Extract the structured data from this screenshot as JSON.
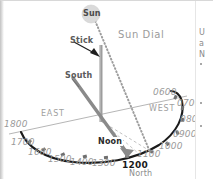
{
  "figure": {
    "title": "Sun Dial",
    "sun_label": "Sun",
    "stick_label": "Stick",
    "south_label": "South",
    "noon_label": "Noon",
    "east_label": "EAST",
    "west_label": "WEST",
    "north_label": "North",
    "noon_hour": "1200"
  },
  "hours": [
    {
      "label": "0600",
      "x": 152,
      "y": 86,
      "cx": 174,
      "cy": 97
    },
    {
      "label": "0700",
      "x": 176,
      "y": 97,
      "cx": 181,
      "cy": 108
    },
    {
      "label": "0800",
      "x": 179,
      "y": 113,
      "cx": 181,
      "cy": 120
    },
    {
      "label": "0900",
      "x": 172,
      "y": 128,
      "cx": 176,
      "cy": 133
    },
    {
      "label": "1000",
      "x": 158,
      "y": 140,
      "cx": 166,
      "cy": 144
    },
    {
      "label": "1100",
      "x": 136,
      "y": 148,
      "cx": 150,
      "cy": 152
    },
    {
      "label": "1300",
      "x": 91,
      "y": 157,
      "cx": 105,
      "cy": 157
    },
    {
      "label": "1400",
      "x": 69,
      "y": 156,
      "cx": 84,
      "cy": 157
    },
    {
      "label": "1500",
      "x": 47,
      "y": 153,
      "cx": 62,
      "cy": 155
    },
    {
      "label": "1600",
      "x": 27,
      "y": 146,
      "cx": 43,
      "cy": 150
    },
    {
      "label": "1700",
      "x": 10,
      "y": 136,
      "cx": 29,
      "cy": 142
    },
    {
      "label": "1800",
      "x": 3,
      "y": 118,
      "cx": 22,
      "cy": 131
    }
  ],
  "noon_marker": {
    "cx": 126,
    "cy": 156
  },
  "side_text": {
    "lines": [
      "U",
      "a",
      "N"
    ],
    "bullets": 3
  },
  "colors": {
    "arc": "#1b1b1b",
    "horizon": "#b2b2b2",
    "stick": "#8a8a8a",
    "south_arrow": "#878787",
    "sun_ray": "#9a9a9a",
    "sun_disk": "#d9d9d9",
    "text_gray": "#9a9a9a",
    "background": "#ffffff"
  }
}
